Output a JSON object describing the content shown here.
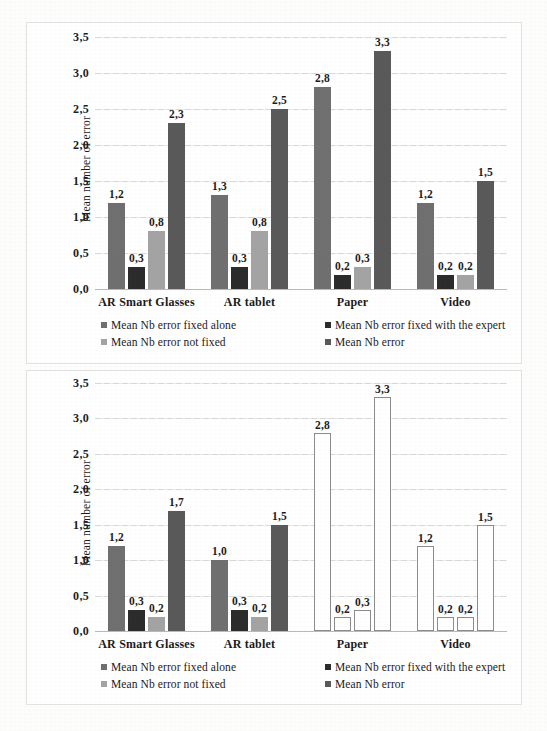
{
  "page": {
    "background_color": "#fdfdfc",
    "panel_border_color": "#e2e2e2",
    "ghost_text": [
      "del",
      "de la",
      "table",
      "Figure",
      "mesures",
      "Comparaison",
      "The"
    ]
  },
  "series_colors": {
    "mean_nb_error_fixed_alone": "#6f6f6f",
    "mean_nb_error_fixed_with_the_expert": "#2b2b2b",
    "mean_nb_error_not_fixed": "#a3a3a3",
    "mean_nb_error": "#595959",
    "hollow_fill": "#ffffff",
    "hollow_border": "#8c8c8c"
  },
  "legend": {
    "items": [
      {
        "label": "Mean Nb error fixed alone",
        "swatch": "#6f6f6f",
        "column": 1,
        "row": 1
      },
      {
        "label": "Mean Nb error fixed with the expert",
        "swatch": "#2b2b2b",
        "column": 2,
        "row": 1
      },
      {
        "label": "Mean Nb error not fixed",
        "swatch": "#a3a3a3",
        "column": 1,
        "row": 2
      },
      {
        "label": "Mean Nb error",
        "swatch": "#595959",
        "column": 2,
        "row": 2
      }
    ]
  },
  "chart_data": [
    {
      "id": "chart-top",
      "type": "bar",
      "title": "",
      "xlabel": "",
      "ylabel": "Mean number of error",
      "ylim": [
        0,
        3.5
      ],
      "ytick_labels": [
        "0,0",
        "0,5",
        "1,0",
        "1,5",
        "2,0",
        "2,5",
        "3,0",
        "3,5"
      ],
      "ytick_values": [
        0,
        0.5,
        1.0,
        1.5,
        2.0,
        2.5,
        3.0,
        3.5
      ],
      "grid": true,
      "legend_position": "bottom",
      "categories": [
        "AR Smart Glasses",
        "AR tablet",
        "Paper",
        "Video"
      ],
      "series": [
        {
          "name": "Mean Nb error fixed alone",
          "color": "#6f6f6f",
          "style": "filled",
          "values": [
            1.2,
            1.3,
            2.8,
            1.2
          ],
          "labels": [
            "1,2",
            "1,3",
            "2,8",
            "1,2"
          ]
        },
        {
          "name": "Mean Nb error fixed with the expert",
          "color": "#2b2b2b",
          "style": "filled",
          "values": [
            0.3,
            0.3,
            0.2,
            0.2
          ],
          "labels": [
            "0,3",
            "0,3",
            "0,2",
            "0,2"
          ]
        },
        {
          "name": "Mean Nb error not fixed",
          "color": "#a3a3a3",
          "style": "filled",
          "values": [
            0.8,
            0.8,
            0.3,
            0.2
          ],
          "labels": [
            "0,8",
            "0,8",
            "0,3",
            "0,2"
          ]
        },
        {
          "name": "Mean Nb error",
          "color": "#595959",
          "style": "filled",
          "values": [
            2.3,
            2.5,
            3.3,
            1.5
          ],
          "labels": [
            "2,3",
            "2,5",
            "3,3",
            "1,5"
          ]
        }
      ]
    },
    {
      "id": "chart-bottom",
      "type": "bar",
      "title": "",
      "xlabel": "",
      "ylabel": "Mean number of error",
      "ylim": [
        0,
        3.5
      ],
      "ytick_labels": [
        "0,0",
        "0,5",
        "1,0",
        "1,5",
        "2,0",
        "2,5",
        "3,0",
        "3,5"
      ],
      "ytick_values": [
        0,
        0.5,
        1.0,
        1.5,
        2.0,
        2.5,
        3.0,
        3.5
      ],
      "grid": true,
      "legend_position": "bottom",
      "categories": [
        "AR Smart Glasses",
        "AR tablet",
        "Paper",
        "Video"
      ],
      "series": [
        {
          "name": "Mean Nb error fixed alone",
          "color": "#6f6f6f",
          "style": "filled",
          "values": [
            1.2,
            1.0,
            2.8,
            1.2
          ],
          "labels": [
            "1,2",
            "1,0",
            "2,8",
            "1,2"
          ],
          "hollow_categories": [
            "Paper",
            "Video"
          ]
        },
        {
          "name": "Mean Nb error fixed with the expert",
          "color": "#2b2b2b",
          "style": "filled",
          "values": [
            0.3,
            0.3,
            0.2,
            0.2
          ],
          "labels": [
            "0,3",
            "0,3",
            "0,2",
            "0,2"
          ],
          "hollow_categories": [
            "Paper",
            "Video"
          ]
        },
        {
          "name": "Mean Nb error not fixed",
          "color": "#a3a3a3",
          "style": "filled",
          "values": [
            0.2,
            0.2,
            0.3,
            0.2
          ],
          "labels": [
            "0,2",
            "0,2",
            "0,3",
            "0,2"
          ],
          "hollow_categories": [
            "Paper",
            "Video"
          ]
        },
        {
          "name": "Mean Nb error",
          "color": "#595959",
          "style": "filled",
          "values": [
            1.7,
            1.5,
            3.3,
            1.5
          ],
          "labels": [
            "1,7",
            "1,5",
            "3,3",
            "1,5"
          ],
          "hollow_categories": [
            "Paper",
            "Video"
          ]
        }
      ]
    }
  ]
}
